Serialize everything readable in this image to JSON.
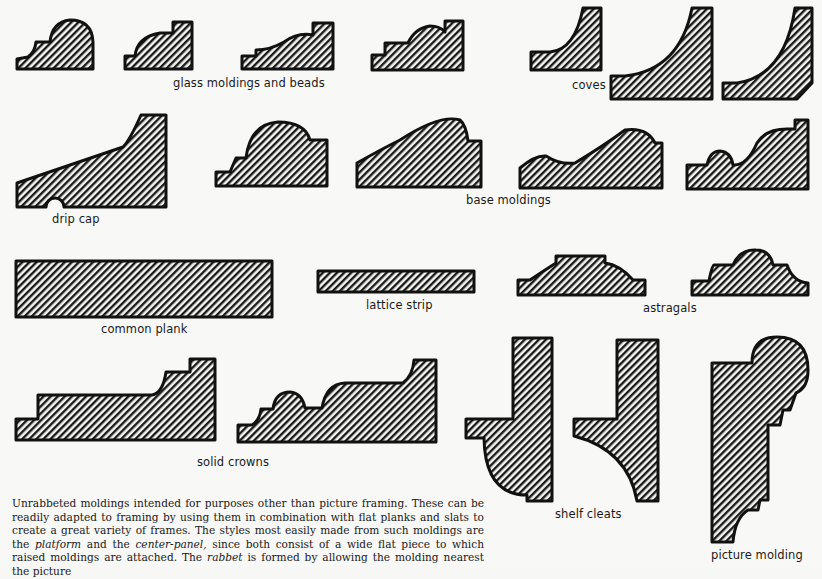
{
  "figure": {
    "groups": [
      {
        "id": "glass",
        "label": "glass moldings and beads",
        "count": 4
      },
      {
        "id": "coves",
        "label": "coves",
        "count": 3
      },
      {
        "id": "drip_cap",
        "label": "drip cap",
        "count": 1
      },
      {
        "id": "base",
        "label": "base moldings",
        "count": 4
      },
      {
        "id": "plank",
        "label": "common plank",
        "count": 1
      },
      {
        "id": "lattice",
        "label": "lattice strip",
        "count": 1
      },
      {
        "id": "astragals",
        "label": "astragals",
        "count": 2
      },
      {
        "id": "crowns",
        "label": "solid crowns",
        "count": 2
      },
      {
        "id": "cleats",
        "label": "shelf cleats",
        "count": 2
      },
      {
        "id": "picture",
        "label": "picture molding",
        "count": 1
      }
    ]
  },
  "caption": {
    "part1": "Unrabbeted moldings intended for purposes other than picture framing. These can be readily adapted to framing by using them in combination with flat planks and slats to create a great variety of frames. The styles most easily made from such moldings are the ",
    "em1": "platform",
    "part2": " and the ",
    "em2": "center-panel,",
    "part3": " since both consist of a wide flat piece to which raised moldings are attached. The ",
    "em3": "rabbet",
    "part4": " is formed by allowing the molding nearest the picture"
  },
  "colors": {
    "paper": "#f8f8f6",
    "ink": "#111111"
  }
}
